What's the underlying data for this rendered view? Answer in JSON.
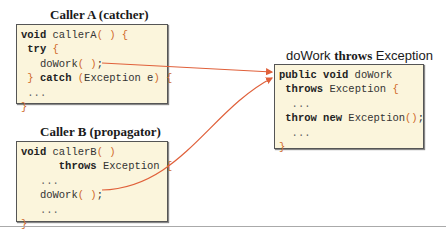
{
  "caller_a": {
    "title": "Caller A (catcher)",
    "lines": [
      "void callerA( ) {",
      " try {",
      "   doWork( );",
      " } catch (Exception e) {",
      " ...",
      "}"
    ]
  },
  "caller_b": {
    "title": "Caller B (propagator)",
    "lines": [
      "void callerB( )",
      "      throws Exception {",
      "   ...",
      "   doWork( );",
      "   ...",
      "}"
    ]
  },
  "dowork": {
    "title_name": "doWork",
    "title_kw": "throws",
    "title_type": "Exception",
    "lines": [
      "public void doWork",
      " throws Exception {",
      "  ...",
      " throw new Exception();",
      "  ...",
      "}"
    ]
  },
  "colors": {
    "arrow": "#e0603a",
    "box_bg": "#fbf5dc",
    "brace": "#d06a2a"
  }
}
